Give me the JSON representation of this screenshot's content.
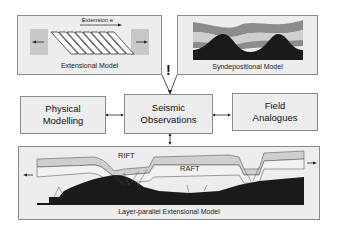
{
  "diagram": {
    "panels": {
      "extensional": {
        "title": "Extensional Model",
        "annotation": "Extension e"
      },
      "syndepositional": {
        "title": "Syndepositional Model"
      },
      "layer_parallel": {
        "title": "Layer-parallel Extensional Model",
        "labels": [
          "RIFT",
          "RAFT"
        ]
      }
    },
    "nodes": {
      "physical": "Physical Modelling",
      "seismic": "Seismic Observations",
      "field": "Field Analogues"
    },
    "exclamation": "!",
    "colors": {
      "panel_fill": "#ededed",
      "dark_layer": "#1a1a1a",
      "mid_layer": "#8c8c8c",
      "light_layer": "#cfcfcf"
    }
  }
}
